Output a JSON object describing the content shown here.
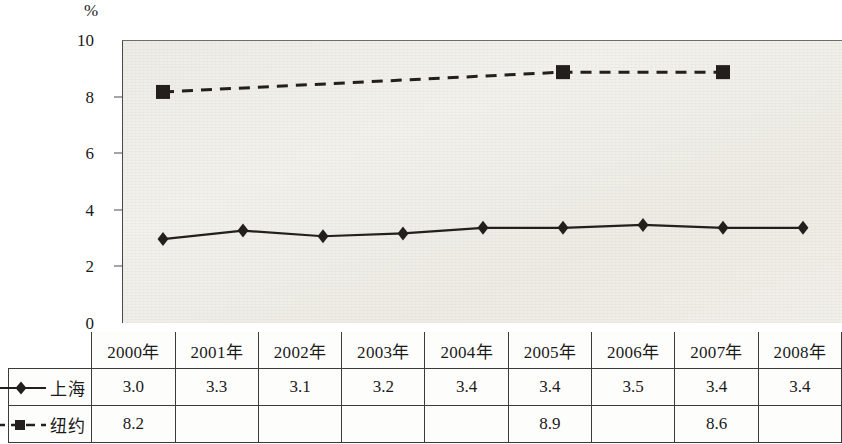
{
  "axis": {
    "unit_label": "%",
    "y_ticks": [
      "10",
      "8",
      "6",
      "4",
      "2",
      "0"
    ]
  },
  "table": {
    "corner_label": "",
    "year_headers": [
      "2000年",
      "2001年",
      "2002年",
      "2003年",
      "2004年",
      "2005年",
      "2006年",
      "2007年",
      "2008年"
    ],
    "rows": [
      {
        "name": "上海",
        "marker": "diamond",
        "line_style": "solid",
        "values": [
          "3.0",
          "3.3",
          "3.1",
          "3.2",
          "3.4",
          "3.4",
          "3.5",
          "3.4",
          "3.4"
        ]
      },
      {
        "name": "纽约",
        "marker": "square",
        "line_style": "dashed",
        "values": [
          "8.2",
          "",
          "",
          "",
          "",
          "8.9",
          "",
          "8.6",
          ""
        ]
      }
    ]
  },
  "chart_data": {
    "type": "line",
    "title": "",
    "subtitle": "",
    "xlabel": "",
    "ylabel": "%",
    "ylim": [
      0,
      10
    ],
    "yticks": [
      0,
      2,
      4,
      6,
      8,
      10
    ],
    "grid": false,
    "legend_position": "table-row-labels",
    "categories": [
      "2000年",
      "2001年",
      "2002年",
      "2003年",
      "2004年",
      "2005年",
      "2006年",
      "2007年",
      "2008年"
    ],
    "series": [
      {
        "name": "上海",
        "marker": "diamond",
        "line_style": "solid",
        "color": "#231f1c",
        "values": [
          3.0,
          3.3,
          3.1,
          3.2,
          3.4,
          3.4,
          3.5,
          3.4,
          3.4
        ]
      },
      {
        "name": "纽约",
        "marker": "square",
        "line_style": "dashed",
        "color": "#231f1c",
        "values": [
          8.2,
          null,
          null,
          null,
          null,
          8.9,
          null,
          8.9,
          null
        ],
        "table_values": [
          8.2,
          null,
          null,
          null,
          null,
          8.9,
          null,
          8.6,
          null
        ]
      }
    ]
  }
}
